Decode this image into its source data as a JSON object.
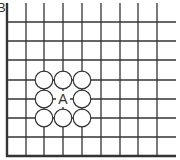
{
  "diagram": {
    "type": "go-board-corner",
    "corner_label": "B",
    "center_label": "A",
    "grid": {
      "x_lines": [
        26,
        44,
        63,
        82,
        101,
        120,
        138,
        157
      ],
      "y_lines": [
        22,
        41,
        60,
        80,
        99,
        118,
        137
      ],
      "left_edge_x": 7,
      "bottom_edge_y": 156,
      "right_extent": 176,
      "top_extent": 3
    },
    "stones": [
      {
        "x": 44,
        "y": 80,
        "color": "white"
      },
      {
        "x": 63,
        "y": 80,
        "color": "white"
      },
      {
        "x": 82,
        "y": 80,
        "color": "white"
      },
      {
        "x": 44,
        "y": 99,
        "color": "white"
      },
      {
        "x": 82,
        "y": 99,
        "color": "white"
      },
      {
        "x": 44,
        "y": 118,
        "color": "white"
      },
      {
        "x": 63,
        "y": 118,
        "color": "white"
      },
      {
        "x": 82,
        "y": 118,
        "color": "white"
      }
    ],
    "marked_point": {
      "x": 63,
      "y": 99,
      "label": "A"
    },
    "colors": {
      "line": "#333333",
      "stone_fill": "#ffffff",
      "stone_stroke": "#333333",
      "background": "#ffffff"
    }
  }
}
